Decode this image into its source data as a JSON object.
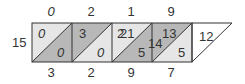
{
  "diagram": {
    "type": "lattice-multiplication",
    "top_digits": [
      "0",
      "2",
      "1",
      "9"
    ],
    "bottom_digits": [
      "3",
      "2",
      "9",
      "7"
    ],
    "left_label": "15",
    "cells": [
      {
        "upper": "0",
        "lower": "0"
      },
      {
        "upper": "3",
        "lower": "0"
      },
      {
        "upper": "21",
        "lower": "5",
        "overlay": "2"
      },
      {
        "upper": "13",
        "lower": "5",
        "overlay": "14"
      }
    ],
    "end_cell": "12",
    "colors": {
      "light": "#e6e6e6",
      "dark": "#b8b8b8",
      "white": "#ffffff",
      "stroke": "#333333"
    }
  }
}
